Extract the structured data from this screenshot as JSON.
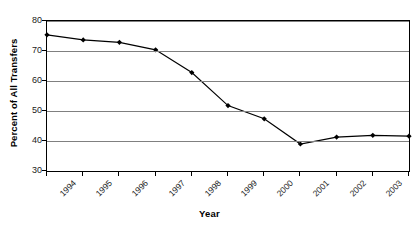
{
  "chart_data": {
    "type": "line",
    "title": "",
    "subtitle": "",
    "xlabel": "Year",
    "ylabel": "Percent of All Transfers",
    "categories": [
      "1994",
      "1995",
      "1996",
      "1997",
      "1998",
      "1999",
      "2000",
      "2001",
      "2002",
      "2003",
      "2004"
    ],
    "x": [
      1994,
      1995,
      1996,
      1997,
      1998,
      1999,
      2000,
      2001,
      2002,
      2003,
      2004
    ],
    "values": [
      75.4,
      73.7,
      72.9,
      70.4,
      62.8,
      51.8,
      47.4,
      39.0,
      41.3,
      41.9,
      41.6
    ],
    "series": [
      {
        "name": "Percent of All Transfers",
        "values": [
          75.4,
          73.7,
          72.9,
          70.4,
          62.8,
          51.8,
          47.4,
          39.0,
          41.3,
          41.9,
          41.6
        ]
      }
    ],
    "ylim": [
      30,
      80
    ],
    "yticks": [
      30,
      40,
      50,
      60,
      70,
      80
    ],
    "ytick_labels": [
      "30",
      "40",
      "50",
      "60",
      "70",
      "80"
    ],
    "xlim": [
      1994,
      2004
    ],
    "grid": "horizontal",
    "legend": "none",
    "marker": "diamond",
    "line_color": "#000000",
    "marker_color": "#000000",
    "gridline_color": "#808080",
    "axis_color": "#000000",
    "background_color": "#ffffff"
  }
}
